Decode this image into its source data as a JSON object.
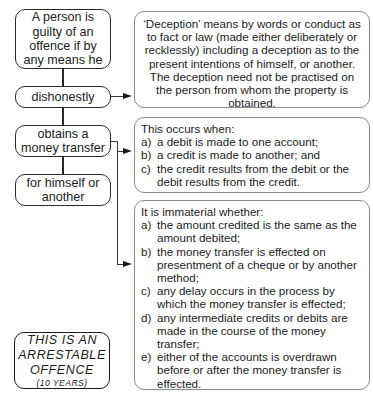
{
  "left_chain": {
    "intro": "A person is guilty of an offence if by any means he",
    "element1": "dishonestly",
    "element2": "obtains a money transfer",
    "element3": "for himself or another"
  },
  "deception_box": {
    "text": "‘Deception’ means by words or conduct as to fact or law (made either deliberately or recklessly) including a deception as to the present intentions of himself, or another. The deception need not be practised on the person from whom the property is obtained."
  },
  "occurs_box": {
    "heading": "This occurs when:",
    "items": [
      {
        "marker": "a)",
        "text": "a debit is made to one account;"
      },
      {
        "marker": "b)",
        "text": "a credit is made to another; and"
      },
      {
        "marker": "c)",
        "text": "the credit results from the debit or the debit results from the credit."
      }
    ]
  },
  "immaterial_box": {
    "heading": "It is immaterial whether:",
    "items": [
      {
        "marker": "a)",
        "text": "the amount credited is the same as the amount debited;"
      },
      {
        "marker": "b)",
        "text": "the money transfer is effected on presentment of a cheque or by another method;"
      },
      {
        "marker": "c)",
        "text": "any delay occurs in the process by which the money transfer is effected;"
      },
      {
        "marker": "d)",
        "text": "any intermediate credits or debits are made in the course of the money transfer;"
      },
      {
        "marker": "e)",
        "text": "either of the accounts is overdrawn before or after the money transfer is effected."
      }
    ]
  },
  "arrestable": {
    "line1": "THIS IS AN",
    "line2": "ARRESTABLE",
    "line3": "OFFENCE",
    "line4": "(10 YEARS)"
  }
}
